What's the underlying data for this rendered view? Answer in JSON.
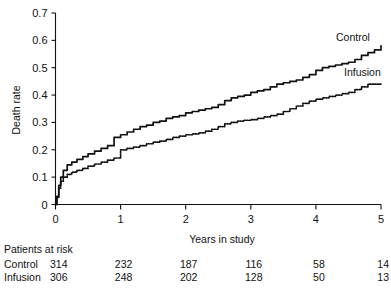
{
  "chart_data": {
    "type": "line",
    "title": "",
    "xlabel": "Years in study",
    "ylabel": "Death rate",
    "xlim": [
      0,
      5
    ],
    "ylim": [
      0,
      0.7
    ],
    "xticks": [
      "0",
      "1",
      "2",
      "3",
      "4",
      "5"
    ],
    "yticks": [
      "0",
      "0.1",
      "0.2",
      "0.3",
      "0.4",
      "0.5",
      "0.6",
      "0.7"
    ],
    "grid": false,
    "legend_position": "inline-right",
    "series": [
      {
        "name": "Control",
        "style": "solid",
        "x": [
          0,
          0.02,
          0.05,
          0.08,
          0.12,
          0.18,
          0.25,
          0.33,
          0.42,
          0.5,
          0.6,
          0.7,
          0.8,
          0.9,
          1.0,
          1.1,
          1.2,
          1.3,
          1.4,
          1.5,
          1.6,
          1.7,
          1.8,
          1.9,
          2.0,
          2.1,
          2.2,
          2.3,
          2.4,
          2.5,
          2.6,
          2.7,
          2.8,
          2.9,
          3.0,
          3.1,
          3.2,
          3.3,
          3.4,
          3.5,
          3.6,
          3.7,
          3.8,
          3.9,
          4.0,
          4.1,
          4.2,
          4.3,
          4.4,
          4.5,
          4.6,
          4.7,
          4.8,
          4.9,
          5.0
        ],
        "y": [
          0,
          0.03,
          0.07,
          0.1,
          0.125,
          0.145,
          0.155,
          0.165,
          0.175,
          0.185,
          0.195,
          0.205,
          0.215,
          0.245,
          0.255,
          0.265,
          0.275,
          0.285,
          0.29,
          0.3,
          0.305,
          0.315,
          0.32,
          0.325,
          0.335,
          0.34,
          0.345,
          0.35,
          0.355,
          0.365,
          0.38,
          0.39,
          0.395,
          0.4,
          0.41,
          0.415,
          0.42,
          0.43,
          0.44,
          0.445,
          0.45,
          0.455,
          0.465,
          0.475,
          0.49,
          0.5,
          0.505,
          0.51,
          0.515,
          0.52,
          0.53,
          0.545,
          0.555,
          0.565,
          0.58
        ]
      },
      {
        "name": "Infusion",
        "style": "dotted",
        "x": [
          0,
          0.02,
          0.05,
          0.08,
          0.12,
          0.18,
          0.25,
          0.33,
          0.42,
          0.5,
          0.6,
          0.7,
          0.8,
          0.9,
          1.0,
          1.1,
          1.2,
          1.3,
          1.4,
          1.5,
          1.6,
          1.7,
          1.8,
          1.9,
          2.0,
          2.1,
          2.2,
          2.3,
          2.4,
          2.5,
          2.6,
          2.7,
          2.8,
          2.9,
          3.0,
          3.1,
          3.2,
          3.3,
          3.4,
          3.5,
          3.6,
          3.7,
          3.8,
          3.9,
          4.0,
          4.1,
          4.2,
          4.3,
          4.4,
          4.5,
          4.6,
          4.7,
          4.8,
          4.9,
          5.0
        ],
        "y": [
          0,
          0.025,
          0.06,
          0.085,
          0.1,
          0.11,
          0.118,
          0.125,
          0.132,
          0.14,
          0.148,
          0.155,
          0.162,
          0.17,
          0.2,
          0.205,
          0.21,
          0.215,
          0.222,
          0.228,
          0.232,
          0.238,
          0.245,
          0.25,
          0.255,
          0.258,
          0.262,
          0.268,
          0.275,
          0.285,
          0.295,
          0.3,
          0.305,
          0.308,
          0.31,
          0.315,
          0.32,
          0.325,
          0.33,
          0.34,
          0.35,
          0.36,
          0.37,
          0.378,
          0.385,
          0.39,
          0.395,
          0.4,
          0.405,
          0.41,
          0.42,
          0.43,
          0.44,
          0.44,
          0.44
        ]
      }
    ]
  },
  "labels": {
    "series_control": "Control",
    "series_infusion": "Infusion"
  },
  "risk_table": {
    "heading": "Patients at risk",
    "rows": [
      {
        "label": "Control",
        "values": [
          "314",
          "232",
          "187",
          "116",
          "58",
          "14"
        ]
      },
      {
        "label": "Infusion",
        "values": [
          "306",
          "248",
          "202",
          "128",
          "50",
          "13"
        ]
      }
    ]
  },
  "colors": {
    "ink": "#111111",
    "background": "#ffffff"
  }
}
